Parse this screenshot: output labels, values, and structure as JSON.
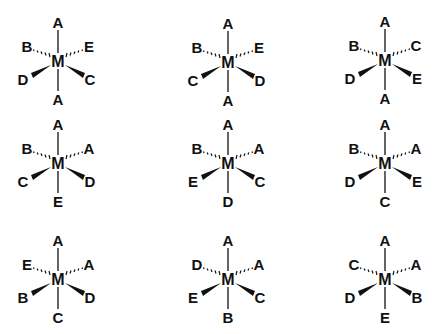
{
  "structures": [
    {
      "id": 1,
      "center": "M",
      "top": "A",
      "bottom": "A",
      "hash_left": "B",
      "hash_right": "E",
      "wedge_left": "D",
      "wedge_right": "C"
    },
    {
      "id": 2,
      "center": "M",
      "top": "A",
      "bottom": "A",
      "hash_left": "B",
      "hash_right": "E",
      "wedge_left": "C",
      "wedge_right": "D"
    },
    {
      "id": 3,
      "center": "M",
      "top": "A",
      "bottom": "A",
      "hash_left": "B",
      "hash_right": "C",
      "wedge_left": "D",
      "wedge_right": "E"
    },
    {
      "id": 4,
      "center": "M",
      "top": "A",
      "bottom": "E",
      "hash_left": "B",
      "hash_right": "A",
      "wedge_left": "C",
      "wedge_right": "D"
    },
    {
      "id": 5,
      "center": "M",
      "top": "A",
      "bottom": "D",
      "hash_left": "B",
      "hash_right": "A",
      "wedge_left": "E",
      "wedge_right": "C"
    },
    {
      "id": 6,
      "center": "M",
      "top": "A",
      "bottom": "C",
      "hash_left": "B",
      "hash_right": "A",
      "wedge_left": "D",
      "wedge_right": "E"
    },
    {
      "id": 7,
      "center": "M",
      "top": "A",
      "bottom": "C",
      "hash_left": "E",
      "hash_right": "A",
      "wedge_left": "B",
      "wedge_right": "D"
    },
    {
      "id": 8,
      "center": "M",
      "top": "A",
      "bottom": "B",
      "hash_left": "D",
      "hash_right": "A",
      "wedge_left": "E",
      "wedge_right": "C"
    },
    {
      "id": 9,
      "center": "M",
      "top": "A",
      "bottom": "E",
      "hash_left": "C",
      "hash_right": "A",
      "wedge_left": "D",
      "wedge_right": "B"
    }
  ],
  "colors": {
    "ink": "#111111",
    "background": "#ffffff"
  }
}
